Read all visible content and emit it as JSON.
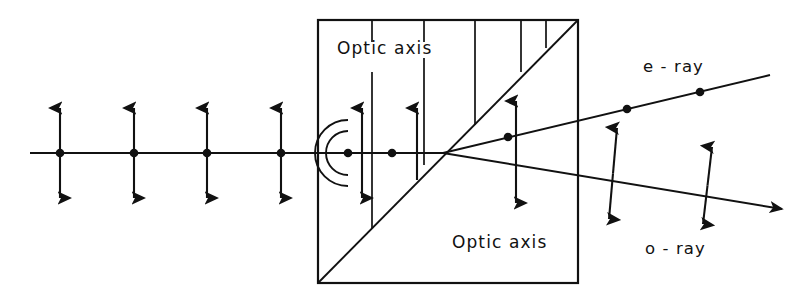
{
  "figure": {
    "width": 801,
    "height": 302,
    "background_color": "#ffffff",
    "ink_color": "#111111"
  },
  "labels": {
    "optic_axis_top": "Optic axis",
    "optic_axis_bottom": "Optic axis",
    "e_ray": "e - ray",
    "o_ray": "o - ray"
  },
  "crystal": {
    "name": "birefringent-crystal-block",
    "x": 318,
    "y": 20,
    "width": 260,
    "height": 263,
    "stroke_width": 2.2,
    "diagonal": {
      "name": "crystal-diagonal",
      "x1": 318,
      "y1": 283,
      "x2": 578,
      "y2": 20
    },
    "optic_axis_ticks": [
      {
        "name": "optic-axis-tick-1",
        "x": 372,
        "segments": [
          [
            20,
            42
          ],
          [
            72,
            228
          ]
        ]
      },
      {
        "name": "optic-axis-tick-2",
        "x": 424,
        "segments": [
          [
            20,
            42
          ],
          [
            58,
            165
          ]
        ]
      },
      {
        "name": "optic-axis-tick-3",
        "x": 475,
        "segments": [
          [
            20,
            125
          ]
        ]
      },
      {
        "name": "optic-axis-tick-4",
        "x": 521,
        "segments": [
          [
            20,
            72
          ]
        ]
      },
      {
        "name": "optic-axis-tick-5",
        "x": 546,
        "segments": [
          [
            20,
            48
          ]
        ]
      }
    ]
  },
  "incident_ray": {
    "name": "incident-unpolarized-ray",
    "y": 153,
    "x_start": 30,
    "x_end": 348,
    "markers": [
      {
        "name": "unpolarized-marker-1",
        "x": 60
      },
      {
        "name": "unpolarized-marker-2",
        "x": 134
      },
      {
        "name": "unpolarized-marker-3",
        "x": 207
      },
      {
        "name": "unpolarized-marker-4",
        "x": 281
      }
    ],
    "arrow_half_length": 45
  },
  "wavefronts": {
    "name": "huygens-wavelets",
    "center_x": 348,
    "center_y": 153,
    "radii": [
      22,
      33
    ],
    "source_dot_x": 348
  },
  "internal": {
    "axis_segment": {
      "name": "internal-axis-line",
      "x1": 348,
      "y1": 153,
      "x2": 443,
      "y2": 153
    },
    "dot": {
      "name": "internal-ray-dot",
      "x": 392,
      "y": 153
    },
    "entry_double_arrow": {
      "name": "entry-polarization-arrow",
      "x": 362,
      "y_top": 108,
      "y_bottom": 198
    },
    "single_arrow": {
      "name": "internal-single-arrow",
      "x": 417,
      "y_base": 180,
      "y_tip": 108
    },
    "split_point": {
      "name": "ray-split-point",
      "x": 443,
      "y": 153
    }
  },
  "exit_rays": {
    "e_ray": {
      "name": "e-ray-path",
      "x1": 443,
      "y1": 153,
      "x2": 770,
      "y2": 75,
      "dots": [
        {
          "name": "e-ray-dot-1",
          "x": 508,
          "y": 137
        },
        {
          "name": "e-ray-dot-2",
          "x": 627,
          "y": 109
        },
        {
          "name": "e-ray-dot-3",
          "x": 700,
          "y": 92
        }
      ],
      "has_arrowhead": false
    },
    "o_ray": {
      "name": "o-ray-path",
      "x1": 443,
      "y1": 153,
      "x2": 782,
      "y2": 209,
      "has_arrowhead": true
    },
    "polarization_arrows": [
      {
        "name": "crystal-exit-polarization-arrow",
        "x1": 516,
        "y1": 101,
        "x2": 516,
        "y2": 203,
        "style": "double"
      },
      {
        "name": "o-ray-polarization-arrow-1",
        "x1": 617,
        "y1": 128,
        "x2": 609,
        "y2": 219,
        "style": "double"
      },
      {
        "name": "o-ray-polarization-arrow-2",
        "x1": 712,
        "y1": 147,
        "x2": 703,
        "y2": 224,
        "style": "double"
      }
    ]
  },
  "label_positions": {
    "optic_axis_top": {
      "x": 337,
      "y": 49
    },
    "optic_axis_bottom": {
      "x": 452,
      "y": 243
    },
    "e_ray": {
      "x": 643,
      "y": 67
    },
    "o_ray": {
      "x": 645,
      "y": 249
    }
  }
}
